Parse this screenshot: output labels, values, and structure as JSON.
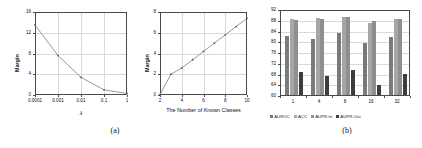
{
  "figure": {
    "captions": [
      {
        "label": "(a)",
        "left": 105,
        "top": 126
      },
      {
        "label": "(b)",
        "left": 337,
        "top": 126
      }
    ]
  },
  "chart_data": [
    {
      "type": "line",
      "panel": "a",
      "title": "",
      "xlabel": "λ",
      "ylabel": "Margin",
      "x": [
        0.0001,
        0.001,
        0.01,
        0.1,
        1
      ],
      "xtick_labels": [
        "0.0001",
        "0.001",
        "0.01",
        "0.1",
        "1"
      ],
      "values": [
        13.5,
        7.6,
        3.4,
        1.0,
        0.3
      ],
      "ytick_labels": [
        "0",
        "4",
        "8",
        "12",
        "16"
      ],
      "yticks": [
        0,
        4,
        8,
        12,
        16
      ],
      "ylim": [
        0,
        16
      ],
      "grid": true,
      "legend": "none",
      "line_color": "#8c8c8c",
      "marker": "dot"
    },
    {
      "type": "line",
      "panel": "middle",
      "title": "",
      "xlabel": "The Number of Known Classes",
      "ylabel": "Margin",
      "x": [
        2,
        3,
        4,
        5,
        6,
        7,
        8,
        9,
        10
      ],
      "xtick_labels": [
        "2",
        "4",
        "6",
        "8",
        "10"
      ],
      "xticks": [
        2,
        4,
        6,
        8,
        10
      ],
      "xlim": [
        2,
        10
      ],
      "values": [
        0.05,
        2.0,
        2.6,
        3.4,
        4.2,
        5.0,
        5.8,
        6.6,
        7.4
      ],
      "ytick_labels": [
        "0",
        "2",
        "4",
        "6",
        "8"
      ],
      "yticks": [
        0,
        2,
        4,
        6,
        8
      ],
      "ylim": [
        0,
        8
      ],
      "grid": true,
      "legend": "none",
      "line_color": "#8c8c8c",
      "marker": "dot"
    },
    {
      "type": "bar",
      "panel": "b",
      "title": "",
      "xlabel": "",
      "ylabel": "",
      "categories": [
        "1",
        "4",
        "8",
        "16",
        "32"
      ],
      "ytick_labels": [
        "60",
        "64",
        "68",
        "72",
        "76",
        "80",
        "84",
        "88",
        "92"
      ],
      "yticks": [
        60,
        64,
        68,
        72,
        76,
        80,
        84,
        88,
        92
      ],
      "ylim": [
        60,
        92
      ],
      "grid": true,
      "legend_position": "bottom",
      "series": [
        {
          "name": "AUROC",
          "color": "#7a7a7a",
          "values": [
            82.0,
            81.0,
            83.0,
            79.5,
            81.5
          ]
        },
        {
          "name": "ACC",
          "color": "#a6a6a6",
          "values": [
            88.2,
            88.5,
            89.2,
            86.8,
            88.4
          ]
        },
        {
          "name": "AUPR-In",
          "color": "#8f8f8f",
          "values": [
            88.0,
            88.3,
            89.0,
            87.5,
            88.2
          ]
        },
        {
          "name": "AUPR-Out",
          "color": "#3d3d3d",
          "values": [
            68.5,
            67.2,
            69.2,
            63.8,
            67.8
          ]
        }
      ]
    }
  ]
}
